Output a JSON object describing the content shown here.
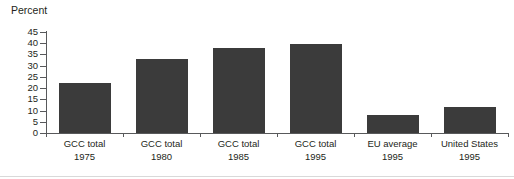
{
  "chart_data": {
    "type": "bar",
    "title": "Percent",
    "xlabel": "",
    "ylabel": "Percent",
    "ylim": [
      0,
      45
    ],
    "yticks": [
      0,
      5,
      10,
      15,
      20,
      25,
      30,
      35,
      40,
      45
    ],
    "grid": false,
    "legend": null,
    "bar_color": "#3b3b3b",
    "axis_color": "#58595b",
    "categories": [
      {
        "line1": "GCC total",
        "line2": "1975"
      },
      {
        "line1": "GCC total",
        "line2": "1980"
      },
      {
        "line1": "GCC total",
        "line2": "1985"
      },
      {
        "line1": "GCC total",
        "line2": "1995"
      },
      {
        "line1": "EU average",
        "line2": "1995"
      },
      {
        "line1": "United States",
        "line2": "1995"
      }
    ],
    "values": [
      22.5,
      33,
      38,
      39.5,
      8,
      11.5
    ]
  }
}
